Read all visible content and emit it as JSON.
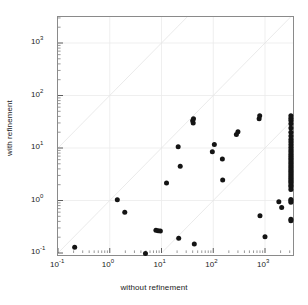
{
  "chart_data": {
    "type": "scatter",
    "title": "",
    "xlabel": "without refinement",
    "ylabel": "with refinement",
    "xscale": "log",
    "yscale": "log",
    "xlim": [
      0.1,
      3162.3
    ],
    "ylim": [
      0.1,
      3162.3
    ],
    "grid": true,
    "legend": null,
    "xticklabels": [
      "10-1",
      "100",
      "101",
      "102",
      "103"
    ],
    "yticklabels": [
      "10-1",
      "100",
      "101",
      "102",
      "103"
    ],
    "xtick_exponents": [
      "-1",
      "0",
      "1",
      "2",
      "3"
    ],
    "ytick_exponents": [
      "-1",
      "0",
      "1",
      "2",
      "3"
    ],
    "marker": "filled-circle",
    "marker_color": "#141414",
    "reference_lines": [
      {
        "name": "identity",
        "slope": 1,
        "intercept": 0
      },
      {
        "name": "upper-offset",
        "slope": 1,
        "intercept": 2
      },
      {
        "name": "lower-offset",
        "slope": 1,
        "intercept": -2
      }
    ],
    "points": [
      [
        0.21,
        0.128
      ],
      [
        1.4,
        1.03
      ],
      [
        1.95,
        0.6
      ],
      [
        4.9,
        0.098
      ],
      [
        7.8,
        0.27
      ],
      [
        8.6,
        0.265
      ],
      [
        9.5,
        0.262
      ],
      [
        12.5,
        2.15
      ],
      [
        21.0,
        10.6
      ],
      [
        21.5,
        0.19
      ],
      [
        23.0,
        4.5
      ],
      [
        40.0,
        33.0
      ],
      [
        41.0,
        30.0
      ],
      [
        41.5,
        36.0
      ],
      [
        43.0,
        0.148
      ],
      [
        96.0,
        8.5
      ],
      [
        105.0,
        11.6
      ],
      [
        150.0,
        6.2
      ],
      [
        152.0,
        2.45
      ],
      [
        280.0,
        18.0
      ],
      [
        300.0,
        20.5
      ],
      [
        770.0,
        36.0
      ],
      [
        790.0,
        41.0
      ],
      [
        800.0,
        0.51
      ],
      [
        1000.0,
        0.205
      ],
      [
        1850.0,
        0.95
      ],
      [
        2100.0,
        0.735
      ],
      [
        3162.3,
        41.0
      ],
      [
        3162.3,
        37.0
      ],
      [
        3162.3,
        33.5
      ],
      [
        3162.3,
        29.0
      ],
      [
        3162.3,
        24.0
      ],
      [
        3162.3,
        20.0
      ],
      [
        3162.3,
        17.0
      ],
      [
        3162.3,
        14.5
      ],
      [
        3162.3,
        13.0
      ],
      [
        3162.3,
        11.5
      ],
      [
        3162.3,
        10.2
      ],
      [
        3162.3,
        9.2
      ],
      [
        3162.3,
        8.4
      ],
      [
        3162.3,
        7.6
      ],
      [
        3162.3,
        7.0
      ],
      [
        3162.3,
        6.4
      ],
      [
        3162.3,
        5.9
      ],
      [
        3162.3,
        5.4
      ],
      [
        3162.3,
        5.0
      ],
      [
        3162.3,
        4.6
      ],
      [
        3162.3,
        4.25
      ],
      [
        3162.3,
        3.9
      ],
      [
        3162.3,
        3.6
      ],
      [
        3162.3,
        3.35
      ],
      [
        3162.3,
        3.1
      ],
      [
        3162.3,
        2.85
      ],
      [
        3162.3,
        2.65
      ],
      [
        3162.3,
        2.45
      ],
      [
        3162.3,
        2.3
      ],
      [
        3162.3,
        2.15
      ],
      [
        3162.3,
        1.95
      ],
      [
        3162.3,
        1.82
      ],
      [
        3162.3,
        1.62
      ],
      [
        3162.3,
        1.05
      ],
      [
        3162.3,
        0.99
      ],
      [
        3162.3,
        0.93
      ],
      [
        3162.3,
        0.44
      ],
      [
        3162.3,
        0.41
      ]
    ]
  }
}
